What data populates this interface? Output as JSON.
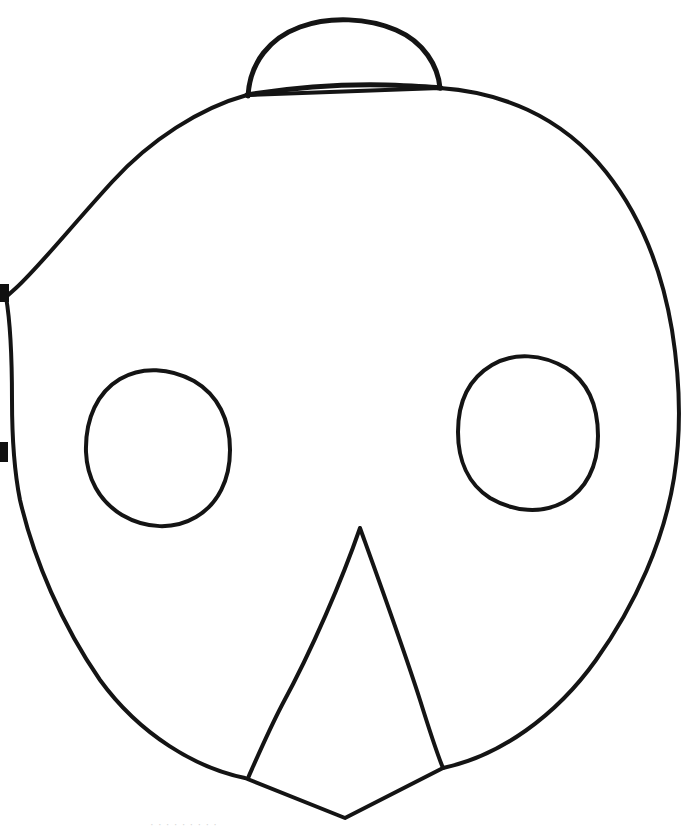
{
  "document": {
    "title": "Hand-drawn Mask Outline Template",
    "medium": "ink line drawing on white paper",
    "canvas": {
      "width": 688,
      "height": 829
    },
    "background_color": "#ffffff",
    "ink_color": "#141414"
  },
  "figure": {
    "name": "mask-face-outline",
    "parts": [
      {
        "id": "head-outline",
        "label": "Head outline",
        "stroke_width": 4,
        "closed": true,
        "path": "M 247 95 C 200 108 150 140 112 182 C 70 228 38 268 16 288 L 6 297 C 10 320 12 360 12 400 C 12 440 14 470 20 500 C 34 560 62 625 100 680 C 140 735 196 768 245 778 L 345 818 L 443 768 C 500 756 556 716 596 660 C 636 604 664 540 674 478 C 682 428 680 380 672 330 C 662 270 640 215 606 172 C 560 114 498 92 440 88 L 247 95 Z"
      },
      {
        "id": "top-dome",
        "label": "Top dome / bun",
        "stroke_width": 5,
        "closed": false,
        "path": "M 248 96 C 250 62 270 38 300 27 C 330 16 368 18 396 30 C 424 42 438 66 440 88"
      },
      {
        "id": "crown-line",
        "label": "Crown line under dome",
        "stroke_width": 5,
        "closed": false,
        "path": "M 247 95 C 290 88 340 84 386 85 C 412 86 430 87 441 88"
      },
      {
        "id": "eye-left",
        "label": "Left eye hole",
        "stroke_width": 4,
        "closed": true,
        "center": [
          158,
          450
        ],
        "radius": 72,
        "path": "M 86 452 C 85 418 98 392 120 379 C 142 366 170 368 194 381 C 218 395 230 420 230 450 C 230 480 218 504 196 517 C 174 530 146 529 122 515 C 99 501 87 478 86 452 Z"
      },
      {
        "id": "eye-right",
        "label": "Right eye hole",
        "stroke_width": 4,
        "closed": true,
        "center": [
          527,
          435
        ],
        "radius": 70,
        "path": "M 458 432 C 458 400 470 378 492 365 C 514 352 542 354 566 368 C 588 382 598 406 598 436 C 598 466 586 490 564 502 C 542 514 514 512 490 498 C 468 484 458 460 458 432 Z"
      },
      {
        "id": "beak",
        "label": "Beak / nose",
        "stroke_width": 4,
        "closed": false,
        "apex": [
          360,
          528
        ],
        "left_foot": [
          248,
          778
        ],
        "right_foot": [
          443,
          768
        ],
        "path": "M 360 528 C 342 580 312 650 282 705 C 268 732 256 760 248 778 M 360 528 C 378 578 402 644 420 700 C 430 732 438 756 443 768"
      }
    ],
    "edge_artifacts": [
      {
        "id": "scan-mark-left-upper",
        "x": 0,
        "y": 284,
        "width": 9,
        "height": 18,
        "color": "#101010"
      },
      {
        "id": "scan-mark-left-lower",
        "x": 0,
        "y": 442,
        "width": 8,
        "height": 20,
        "color": "#101010"
      }
    ],
    "bottom_caption": {
      "visible": false,
      "note": "faint cut-off text tops along the very bottom scan edge, illegible",
      "ghost_text": "· · ·  · ·    ·   ·     ·      ·"
    }
  }
}
